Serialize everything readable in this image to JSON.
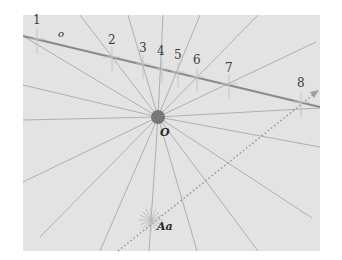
{
  "diagram": {
    "panel": {
      "x": 23,
      "y": 15,
      "width": 297,
      "height": 236,
      "fill": "#e3e3e3"
    },
    "center": {
      "label": "O",
      "x": 158,
      "y": 117,
      "r": 7,
      "fill": "#777777"
    },
    "line_label": "o",
    "line": {
      "x1": 23,
      "y1": 36,
      "x2": 320,
      "y2": 107,
      "color": "#8a8a8a"
    },
    "points": [
      {
        "label": "1",
        "x": 37,
        "y": 39
      },
      {
        "label": "2",
        "x": 112,
        "y": 57
      },
      {
        "label": "3",
        "x": 143,
        "y": 64
      },
      {
        "label": "4",
        "x": 162,
        "y": 69
      },
      {
        "label": "5",
        "x": 178,
        "y": 72
      },
      {
        "label": "6",
        "x": 197,
        "y": 77
      },
      {
        "label": "7",
        "x": 229,
        "y": 84
      },
      {
        "label": "8",
        "x": 301,
        "y": 102
      }
    ],
    "source_point": {
      "label": "Aa",
      "x": 151,
      "y": 220
    },
    "ray_color": "#a8a8a8",
    "dotted_color": "#909090"
  }
}
